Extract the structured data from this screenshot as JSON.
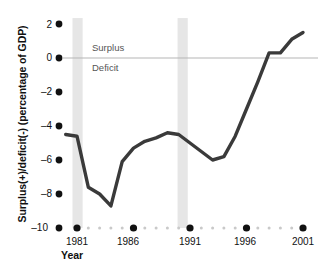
{
  "chart_data": {
    "type": "line",
    "title": "",
    "xlabel": "Year",
    "ylabel": "Surplus(+)/deficit(-) (percentage of GDP)",
    "xlim": [
      1980,
      2001
    ],
    "ylim": [
      -10,
      2
    ],
    "grid": false,
    "legend": null,
    "zero_line": 0,
    "yticks": [
      2,
      0,
      -2,
      -4,
      -6,
      -8,
      -10
    ],
    "ytick_labels": [
      "2",
      "0",
      "–2",
      "–4",
      "–6",
      "–8",
      "–10"
    ],
    "xticks": [
      1981,
      1986,
      1991,
      1996,
      2001
    ],
    "xtick_labels": [
      "1981",
      "1986",
      "1991",
      "1996",
      "2001"
    ],
    "x": [
      1980,
      1981,
      1982,
      1983,
      1984,
      1985,
      1986,
      1987,
      1988,
      1989,
      1990,
      1991,
      1992,
      1993,
      1994,
      1995,
      1996,
      1997,
      1998,
      1999,
      2000,
      2001
    ],
    "values": [
      -4.5,
      -4.6,
      -7.6,
      -8.0,
      -8.7,
      -6.1,
      -5.3,
      -4.9,
      -4.7,
      -4.4,
      -4.5,
      -5.0,
      -5.5,
      -6.0,
      -5.8,
      -4.6,
      -3.0,
      -1.4,
      0.3,
      0.3,
      1.1,
      1.5
    ],
    "series": [
      {
        "name": "Surplus(+)/deficit(-) (percentage of GDP)",
        "color": "#3a3a3a",
        "values": [
          -4.5,
          -4.6,
          -7.6,
          -8.0,
          -8.7,
          -6.1,
          -5.3,
          -4.9,
          -4.7,
          -4.4,
          -4.5,
          -5.0,
          -5.5,
          -6.0,
          -5.8,
          -4.6,
          -3.0,
          -1.4,
          0.3,
          0.3,
          1.1,
          1.5
        ]
      }
    ],
    "annotations": [
      {
        "text": "Surplus",
        "x": 1982.2,
        "y": 0.75
      },
      {
        "text": "Deficit",
        "x": 1982.2,
        "y": -0.85
      }
    ],
    "shaded_bands": [
      {
        "name": "recession-band-1981",
        "start": 1980.6,
        "end": 1981.5,
        "color": "#e6e6e6"
      },
      {
        "name": "recession-band-1990",
        "start": 1989.9,
        "end": 1990.8,
        "color": "#e6e6e6"
      }
    ],
    "colors": {
      "line": "#3a3a3a",
      "zero_line": "#b5b5b5",
      "band": "#e6e6e6",
      "major_tick": "#111111",
      "minor_tick": "#c9c9c9",
      "text": "#111111",
      "annotation_text": "#555555",
      "background": "#ffffff"
    }
  }
}
